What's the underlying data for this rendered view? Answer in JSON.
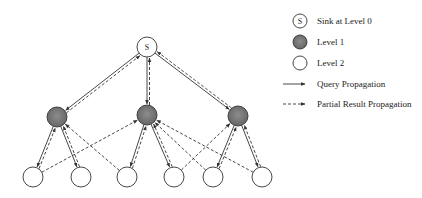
{
  "diagram": {
    "type": "tree",
    "nodes": [
      {
        "id": "S",
        "label": "S",
        "level": 0,
        "x": 147,
        "y": 47
      },
      {
        "id": "A",
        "label": "",
        "level": 1,
        "x": 57,
        "y": 117
      },
      {
        "id": "B",
        "label": "",
        "level": 1,
        "x": 147,
        "y": 115
      },
      {
        "id": "C",
        "label": "",
        "level": 1,
        "x": 238,
        "y": 116
      },
      {
        "id": "L0",
        "label": "",
        "level": 2,
        "x": 33,
        "y": 177
      },
      {
        "id": "L1",
        "label": "",
        "level": 2,
        "x": 81,
        "y": 177
      },
      {
        "id": "L2",
        "label": "",
        "level": 2,
        "x": 127,
        "y": 177
      },
      {
        "id": "L3",
        "label": "",
        "level": 2,
        "x": 174,
        "y": 177
      },
      {
        "id": "L4",
        "label": "",
        "level": 2,
        "x": 213,
        "y": 177
      },
      {
        "id": "L5",
        "label": "",
        "level": 2,
        "x": 262,
        "y": 177
      }
    ],
    "query_edges": [
      [
        "S",
        "A"
      ],
      [
        "S",
        "B"
      ],
      [
        "S",
        "C"
      ],
      [
        "A",
        "L0"
      ],
      [
        "A",
        "L1"
      ],
      [
        "B",
        "L2"
      ],
      [
        "B",
        "L3"
      ],
      [
        "C",
        "L4"
      ],
      [
        "C",
        "L5"
      ]
    ],
    "partial_result_edges": [
      [
        "A",
        "S"
      ],
      [
        "B",
        "S"
      ],
      [
        "C",
        "S"
      ],
      [
        "L0",
        "A"
      ],
      [
        "L1",
        "A"
      ],
      [
        "L2",
        "A"
      ],
      [
        "L0",
        "B"
      ],
      [
        "L2",
        "B"
      ],
      [
        "L3",
        "B"
      ],
      [
        "L4",
        "B"
      ],
      [
        "L5",
        "B"
      ],
      [
        "L3",
        "C"
      ],
      [
        "L4",
        "C"
      ],
      [
        "L5",
        "C"
      ]
    ]
  },
  "legend": {
    "sink": {
      "symbol": "S",
      "label": "Sink at Level 0"
    },
    "level1": {
      "label": "Level 1"
    },
    "level2": {
      "label": "Level 2"
    },
    "query": {
      "label": "Query Propagation"
    },
    "partial": {
      "label": "Partial Result Propagation"
    }
  },
  "colors": {
    "level1_fill": "#7a7a7a",
    "stroke": "#333333",
    "background": "#ffffff"
  }
}
